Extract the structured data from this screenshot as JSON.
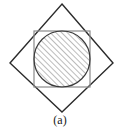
{
  "figure": {
    "caption": "(a)",
    "colors": {
      "background": "#ffffff",
      "diamond_stroke": "#2b2b2b",
      "square_stroke": "#8a8a8a",
      "circle_stroke": "#3a3a3a",
      "hatch_stroke": "#6b6b6b",
      "caption_text": "#1a1a1a"
    },
    "shapes": {
      "diamond": {
        "name": "rotated-square",
        "points": "62,4 113,63 62,112 10,63",
        "stroke_width": 1.4,
        "fill": "none"
      },
      "square": {
        "name": "axis-aligned-square",
        "x": 34,
        "y": 31,
        "width": 56,
        "height": 56,
        "stroke_width": 1.2,
        "fill": "none"
      },
      "circle": {
        "name": "inscribed-hatched-circle",
        "cx": 62,
        "cy": 59,
        "r": 28,
        "stroke_width": 1.2,
        "fill": "hatch-pattern"
      },
      "hatch": {
        "angle_deg": 45,
        "direction": "lower-left-to-upper-right",
        "spacing_px": 4,
        "stroke_width": 0.9
      }
    }
  }
}
